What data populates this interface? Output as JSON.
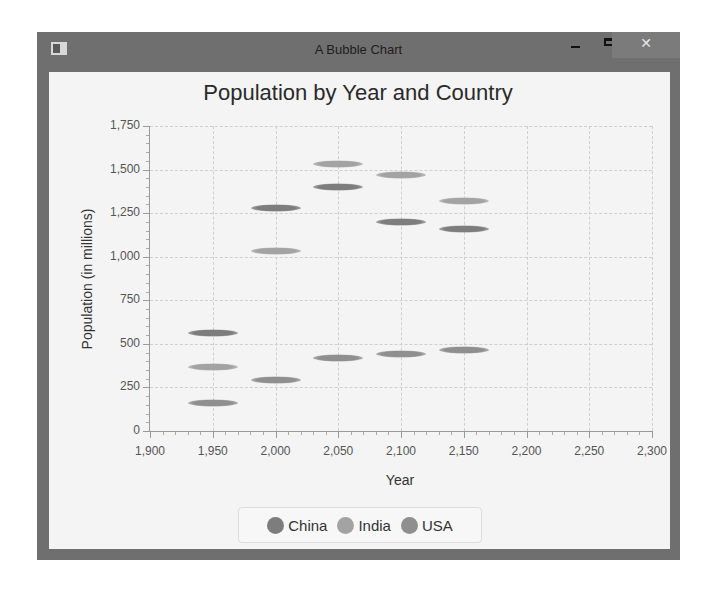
{
  "window": {
    "title": "A Bubble Chart",
    "controls": {
      "minimize": "minimize",
      "maximize": "maximize",
      "close": "✕"
    }
  },
  "chart_data": {
    "type": "bubble",
    "title": "Population by Year and Country",
    "xlabel": "Year",
    "ylabel": "Population (in millions)",
    "xlim": [
      1900,
      2300
    ],
    "ylim": [
      0,
      1750
    ],
    "x_ticks": [
      "1,900",
      "1,950",
      "2,000",
      "2,050",
      "2,100",
      "2,150",
      "2,200",
      "2,250",
      "2,300"
    ],
    "y_ticks": [
      "0",
      "250",
      "500",
      "750",
      "1,000",
      "1,250",
      "1,500",
      "1,750"
    ],
    "grid": true,
    "legend_position": "bottom",
    "series": [
      {
        "name": "China",
        "color": "#7d7d7d",
        "points": [
          {
            "x": 1950,
            "y": 560
          },
          {
            "x": 2000,
            "y": 1280
          },
          {
            "x": 2050,
            "y": 1400
          },
          {
            "x": 2100,
            "y": 1200
          },
          {
            "x": 2150,
            "y": 1160
          }
        ]
      },
      {
        "name": "India",
        "color": "#a3a3a3",
        "points": [
          {
            "x": 1950,
            "y": 370
          },
          {
            "x": 2000,
            "y": 1030
          },
          {
            "x": 2050,
            "y": 1530
          },
          {
            "x": 2100,
            "y": 1470
          },
          {
            "x": 2150,
            "y": 1320
          }
        ]
      },
      {
        "name": "USA",
        "color": "#8f8f8f",
        "points": [
          {
            "x": 1950,
            "y": 160
          },
          {
            "x": 2000,
            "y": 290
          },
          {
            "x": 2050,
            "y": 420
          },
          {
            "x": 2100,
            "y": 440
          },
          {
            "x": 2150,
            "y": 465
          }
        ]
      }
    ]
  },
  "legend": {
    "items": [
      {
        "label": "China",
        "color": "#7d7d7d"
      },
      {
        "label": "India",
        "color": "#a3a3a3"
      },
      {
        "label": "USA",
        "color": "#8f8f8f"
      }
    ]
  }
}
